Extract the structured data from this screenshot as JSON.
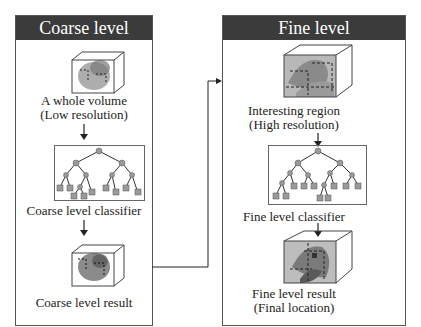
{
  "coarse_panel": {
    "title": "Coarse level",
    "steps": [
      {
        "label_line1": "A whole volume",
        "label_line2": "(Low resolution)",
        "graphic": "volume-cube-icon"
      },
      {
        "label_line1": "Coarse level classifier",
        "graphic": "decision-tree-icon"
      },
      {
        "label_line1": "Coarse level result",
        "graphic": "volume-cube-icon"
      }
    ]
  },
  "fine_panel": {
    "title": "Fine level",
    "steps": [
      {
        "label_line1": "Interesting region",
        "label_line2": "(High resolution)",
        "graphic": "volume-cube-icon"
      },
      {
        "label_line1": "Fine level classifier",
        "graphic": "decision-tree-icon"
      },
      {
        "label_line1": "Fine level result",
        "label_line2": "(Final location)",
        "graphic": "volume-cube-icon"
      }
    ]
  },
  "colors": {
    "header_bg": "#3b3b3b",
    "header_text": "#ffffff",
    "border": "#555555",
    "node_fill": "#9a9a9a",
    "region_fill": "#8a8a8a"
  }
}
